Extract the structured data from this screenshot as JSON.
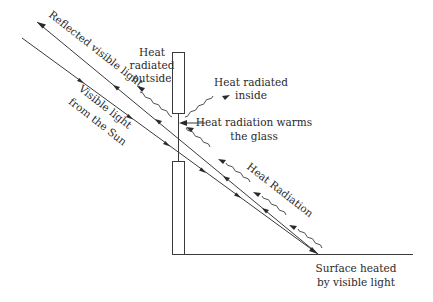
{
  "diagram": {
    "type": "greenhouse-effect-window",
    "labels": {
      "reflected": "Reflected visible light",
      "visible_1": "Visible light",
      "visible_2": "from the Sun",
      "heat_out_1": "Heat",
      "heat_out_2": "radiated",
      "heat_out_3": "outside",
      "heat_in_1": "Heat radiated",
      "heat_in_2": "inside",
      "warms_1": "Heat radiation warms",
      "warms_2": "the glass",
      "heat_radiation": "Heat Radiation",
      "surface_1": "Surface heated",
      "surface_2": "by visible light"
    },
    "colors": {
      "line": "#3a3a3a",
      "text": "#2a2a2a",
      "background": "#ffffff"
    }
  }
}
